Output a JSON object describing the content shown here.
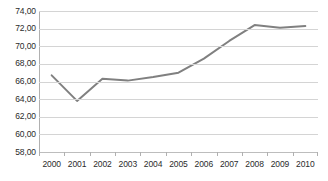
{
  "chart_data": {
    "type": "line",
    "title": "",
    "subtitle": "",
    "xlabel": "",
    "ylabel": "",
    "categories": [
      "2000",
      "2001",
      "2002",
      "2003",
      "2004",
      "2005",
      "2006",
      "2007",
      "2008",
      "2009",
      "2010"
    ],
    "series": [
      {
        "name": "",
        "values": [
          66.7,
          63.8,
          66.3,
          66.1,
          66.5,
          67.0,
          68.6,
          70.6,
          72.4,
          72.1,
          72.3
        ],
        "color": "#808080"
      }
    ],
    "ylim": [
      58.0,
      74.0
    ],
    "ytick_step": 2.0,
    "ytick_labels": [
      "74,00",
      "72,00",
      "70,00",
      "68,00",
      "66,00",
      "64,00",
      "62,00",
      "60,00",
      "58,00"
    ],
    "ytick_values": [
      74.0,
      72.0,
      70.0,
      68.0,
      66.0,
      64.0,
      62.0,
      60.0,
      58.0
    ],
    "grid": true,
    "legend": false,
    "legend_position": "none",
    "markers": false,
    "decimal_separator": ",",
    "gridline_color": "#d4d4d4",
    "axis_color": "#b0b0b0",
    "label_color": "#2b2b2b",
    "background_color": "#ffffff"
  }
}
